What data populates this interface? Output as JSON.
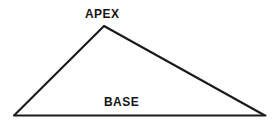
{
  "diagram": {
    "type": "line-drawing",
    "shape": "triangle",
    "shape_name": "scalene-triangle",
    "background_color": "#ffffff",
    "stroke_color": "#1a1a1a",
    "stroke_width": 2,
    "canvas": {
      "width": 272,
      "height": 127
    },
    "vertices": {
      "apex": {
        "x": 104,
        "y": 26
      },
      "bottom_left": {
        "x": 14,
        "y": 115
      },
      "bottom_right": {
        "x": 264,
        "y": 115
      }
    },
    "edges": [
      {
        "name": "left-side",
        "from": "bottom_left",
        "to": "apex"
      },
      {
        "name": "right-side",
        "from": "apex",
        "to": "bottom_right"
      },
      {
        "name": "base",
        "from": "bottom_left",
        "to": "bottom_right"
      }
    ],
    "labels": {
      "apex": "APEX",
      "base": "BASE"
    },
    "label_color": "#141414"
  }
}
